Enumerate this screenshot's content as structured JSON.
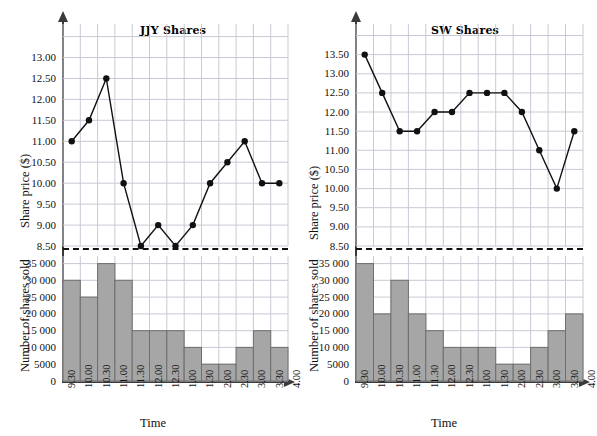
{
  "figure": {
    "panels": [
      {
        "id": "jjy",
        "title": "JJY Shares",
        "price_axis_label": "Share price ($)",
        "volume_axis_label": "Number of shares sold",
        "xlabel": "Time",
        "price_ticks": [
          "13.00",
          "12.50",
          "12.00",
          "11.50",
          "11.00",
          "10.50",
          "10.00",
          "9.50",
          "9.00",
          "8.50"
        ],
        "volume_ticks": [
          "35 000",
          "30 000",
          "25 000",
          "20 000",
          "15 000",
          "10 000",
          "5000",
          "0"
        ],
        "xticks": [
          "9.30",
          "10.00",
          "10.30",
          "11.00",
          "11.30",
          "12.00",
          "12.30",
          "1.00",
          "1.30",
          "2.00",
          "2.30",
          "3.00",
          "3.30",
          "4.00"
        ]
      },
      {
        "id": "sw",
        "title": "SW Shares",
        "price_axis_label": "Share price ($)",
        "volume_axis_label": "Number of shares sold",
        "xlabel": "Time",
        "price_ticks": [
          "13.50",
          "13.00",
          "12.50",
          "12.00",
          "11.50",
          "11.00",
          "10.50",
          "10.00",
          "9.50",
          "9.00",
          "8.50"
        ],
        "volume_ticks": [
          "35 000",
          "30 000",
          "25 000",
          "20 000",
          "15 000",
          "10 000",
          "5000",
          "0"
        ],
        "xticks": [
          "9.30",
          "10.00",
          "10.30",
          "11.00",
          "11.30",
          "12.00",
          "12.30",
          "1.00",
          "1.30",
          "2.00",
          "2.30",
          "3.00",
          "3.30",
          "4.00"
        ]
      }
    ]
  },
  "chart_data": [
    {
      "type": "line",
      "title": "JJY Shares",
      "panel": "jjy-price",
      "xlabel": "Time",
      "ylabel": "Share price ($)",
      "x": [
        "9.30",
        "10.00",
        "10.30",
        "11.00",
        "11.30",
        "12.00",
        "12.30",
        "1.00",
        "1.30",
        "2.00",
        "2.30",
        "3.00",
        "3.30"
      ],
      "values": [
        11.0,
        11.5,
        12.5,
        10.0,
        8.5,
        9.0,
        8.5,
        9.0,
        10.0,
        10.5,
        11.0,
        10.0,
        10.0
      ],
      "ylim": [
        8.5,
        13.0
      ],
      "ytick_step": 0.5,
      "grid": true,
      "marker": "filled-circle",
      "legend": "none"
    },
    {
      "type": "bar",
      "title": "JJY Shares",
      "panel": "jjy-volume",
      "xlabel": "Time",
      "ylabel": "Number of shares sold",
      "categories": [
        "9.30",
        "10.00",
        "10.30",
        "11.00",
        "11.30",
        "12.00",
        "12.30",
        "1.00",
        "1.30",
        "2.00",
        "2.30",
        "3.00",
        "3.30"
      ],
      "values": [
        30000,
        25000,
        35000,
        30000,
        15000,
        15000,
        15000,
        10000,
        5000,
        5000,
        10000,
        15000,
        10000
      ],
      "ylim": [
        0,
        37000
      ],
      "ytick_step": 5000,
      "grid": true,
      "bar_fill": "#a6a6a6",
      "bar_stroke": "#6e6e6e"
    },
    {
      "type": "line",
      "title": "SW Shares",
      "panel": "sw-price",
      "xlabel": "Time",
      "ylabel": "Share price ($)",
      "x": [
        "9.30",
        "10.00",
        "10.30",
        "11.00",
        "11.30",
        "12.00",
        "12.30",
        "1.00",
        "1.30",
        "2.00",
        "2.30",
        "3.00",
        "3.30"
      ],
      "values": [
        13.5,
        12.5,
        11.5,
        11.5,
        12.0,
        12.0,
        12.5,
        12.5,
        12.5,
        12.0,
        11.0,
        10.0,
        11.5
      ],
      "ylim": [
        8.5,
        13.5
      ],
      "ytick_step": 0.5,
      "grid": true,
      "marker": "filled-circle",
      "legend": "none"
    },
    {
      "type": "bar",
      "title": "SW Shares",
      "panel": "sw-volume",
      "xlabel": "Time",
      "ylabel": "Number of shares sold",
      "categories": [
        "9.30",
        "10.00",
        "10.30",
        "11.00",
        "11.30",
        "12.00",
        "12.30",
        "1.00",
        "1.30",
        "2.00",
        "2.30",
        "3.00",
        "3.30"
      ],
      "values": [
        35000,
        20000,
        30000,
        20000,
        15000,
        10000,
        10000,
        10000,
        5000,
        5000,
        10000,
        15000,
        20000
      ],
      "ylim": [
        0,
        37000
      ],
      "ytick_step": 5000,
      "grid": true,
      "bar_fill": "#a6a6a6",
      "bar_stroke": "#6e6e6e"
    }
  ],
  "style": {
    "grid_color": "#c9c9d6",
    "axis_color": "#3a3a3a",
    "line_color": "#111111",
    "separator": "dashed"
  }
}
